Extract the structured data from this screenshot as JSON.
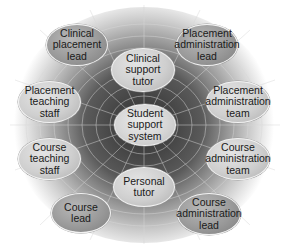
{
  "diagram": {
    "type": "spider-web hub",
    "center": {
      "id": "center",
      "label": "Student support system"
    },
    "nodes": [
      {
        "id": "clinical-placement-lead",
        "label": "Clinical placement lead",
        "tone": "dark"
      },
      {
        "id": "clinical-support-tutor",
        "label": "Clinical support tutor",
        "tone": "light"
      },
      {
        "id": "placement-administration-lead",
        "label": "Placement administration lead",
        "tone": "dark"
      },
      {
        "id": "placement-teaching-staff",
        "label": "Placement teaching staff",
        "tone": "light"
      },
      {
        "id": "placement-administration-team",
        "label": "Placement administration team",
        "tone": "light"
      },
      {
        "id": "course-teaching-staff",
        "label": "Course teaching staff",
        "tone": "light"
      },
      {
        "id": "course-administration-team",
        "label": "Course administration team",
        "tone": "light"
      },
      {
        "id": "personal-tutor",
        "label": "Personal tutor",
        "tone": "light"
      },
      {
        "id": "course-lead",
        "label": "Course lead",
        "tone": "dark"
      },
      {
        "id": "course-administration-lead",
        "label": "Course administration lead",
        "tone": "dark"
      }
    ],
    "colors": {
      "dark_node": "#9a9a9a",
      "light_node": "#d0d0d0",
      "web_dark": "#3a3a3a",
      "web_light": "#dcdcdc"
    }
  }
}
